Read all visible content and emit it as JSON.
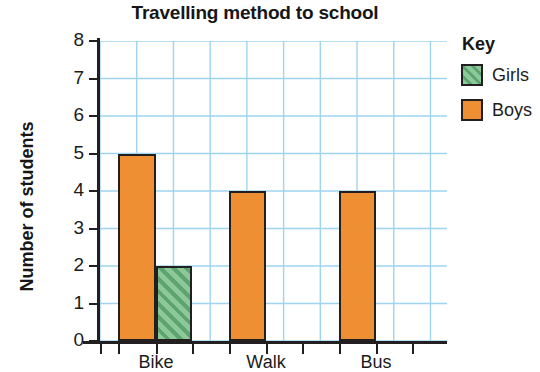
{
  "chart_data": {
    "type": "bar",
    "title": "Travelling method to school",
    "xlabel": "",
    "ylabel": "Number of students",
    "categories": [
      "Bike",
      "Walk",
      "Bus"
    ],
    "series": [
      {
        "name": "Girls",
        "values": [
          2,
          0,
          0
        ],
        "color": "#8cc89a",
        "pattern": "diagonal-hatch"
      },
      {
        "name": "Boys",
        "values": [
          5,
          4,
          4
        ],
        "color": "#ee8f33",
        "pattern": "solid"
      }
    ],
    "ylim": [
      0,
      8
    ],
    "ytick_labels": [
      "0",
      "1",
      "2",
      "3",
      "4",
      "5",
      "6",
      "7",
      "8"
    ],
    "ytick_values": [
      0,
      1,
      2,
      3,
      4,
      5,
      6,
      7,
      8
    ],
    "grid": true,
    "grid_color": "#9fd4f0",
    "legend_position": "right",
    "legend_title": "Key",
    "axis_color": "#231f20"
  },
  "bars": [
    {
      "name": "bike-boys",
      "series": "Boys",
      "category": "Bike",
      "value": 5,
      "x": 18,
      "width": 38
    },
    {
      "name": "bike-girls",
      "series": "Girls",
      "category": "Bike",
      "value": 2,
      "x": 56,
      "width": 36
    },
    {
      "name": "walk-boys",
      "series": "Boys",
      "category": "Walk",
      "value": 4,
      "x": 129,
      "width": 37
    },
    {
      "name": "bus-boys",
      "series": "Boys",
      "category": "Bus",
      "value": 4,
      "x": 239,
      "width": 37
    }
  ],
  "xticks": [
    {
      "label": "",
      "x": 0
    },
    {
      "label": "",
      "x": 18
    },
    {
      "label": "Bike",
      "x": 56
    },
    {
      "label": "",
      "x": 92
    },
    {
      "label": "",
      "x": 129
    },
    {
      "label": "Walk",
      "x": 166
    },
    {
      "label": "",
      "x": 202
    },
    {
      "label": "",
      "x": 239
    },
    {
      "label": "Bus",
      "x": 276
    },
    {
      "label": "",
      "x": 312
    }
  ],
  "xtick_label_positions": [
    {
      "label": "Bike",
      "center": 56
    },
    {
      "label": "Walk",
      "center": 166
    },
    {
      "label": "Bus",
      "center": 276
    }
  ]
}
